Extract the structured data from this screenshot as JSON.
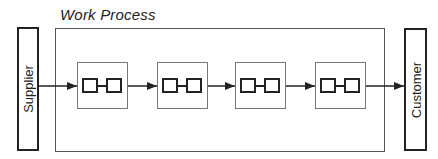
{
  "diagram": {
    "title": "Work Process",
    "supplier_label": "Supplier",
    "customer_label": "Customer",
    "steps": [
      {
        "id": 1,
        "icon": "linked-boxes-icon"
      },
      {
        "id": 2,
        "icon": "linked-boxes-icon"
      },
      {
        "id": 3,
        "icon": "linked-boxes-icon"
      },
      {
        "id": 4,
        "icon": "linked-boxes-icon"
      }
    ],
    "flow": [
      "Supplier",
      "Step 1",
      "Step 2",
      "Step 3",
      "Step 4",
      "Customer"
    ],
    "colors": {
      "stroke": "#222222",
      "box_border": "#555555",
      "background": "#ffffff"
    }
  }
}
